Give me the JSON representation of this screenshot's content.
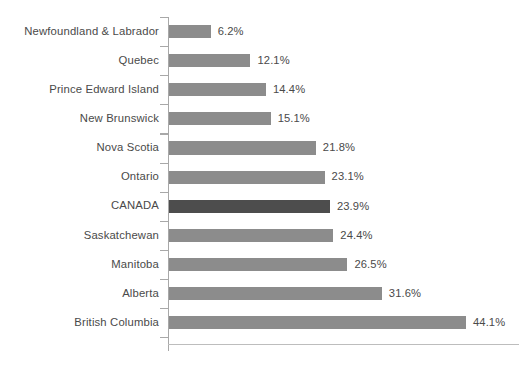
{
  "chart_data": {
    "type": "bar",
    "orientation": "horizontal",
    "title": "",
    "subtitle": "",
    "xlabel": "",
    "ylabel": "",
    "grid": false,
    "legend": null,
    "value_suffix": "%",
    "xlim": [
      0,
      44.1
    ],
    "axis_max_value": 44.1,
    "highlight_category": "CANADA",
    "colors": {
      "bar": "#8c8c8c",
      "bar_highlight": "#4d4d4d",
      "text": "#4a4a4a",
      "axis": "#a8a8a8",
      "baseline": "#bdbdbd",
      "background": "#ffffff"
    },
    "categories": [
      "Newfoundland & Labrador",
      "Quebec",
      "Prince Edward Island",
      "New Brunswick",
      "Nova Scotia",
      "Ontario",
      "CANADA",
      "Saskatchewan",
      "Manitoba",
      "Alberta",
      "British Columbia"
    ],
    "values": [
      6.2,
      12.1,
      14.4,
      15.1,
      21.8,
      23.1,
      23.9,
      24.4,
      26.5,
      31.6,
      44.1
    ],
    "value_labels": [
      "6.2%",
      "12.1%",
      "14.4%",
      "15.1%",
      "21.8%",
      "23.1%",
      "23.9%",
      "24.4%",
      "26.5%",
      "31.6%",
      "44.1%"
    ],
    "bars": [
      {
        "category": "Newfoundland & Labrador",
        "value": 6.2,
        "label": "6.2%",
        "highlighted": false
      },
      {
        "category": "Quebec",
        "value": 12.1,
        "label": "12.1%",
        "highlighted": false
      },
      {
        "category": "Prince Edward Island",
        "value": 14.4,
        "label": "14.4%",
        "highlighted": false
      },
      {
        "category": "New Brunswick",
        "value": 15.1,
        "label": "15.1%",
        "highlighted": false
      },
      {
        "category": "Nova Scotia",
        "value": 21.8,
        "label": "21.8%",
        "highlighted": false
      },
      {
        "category": "Ontario",
        "value": 23.1,
        "label": "23.1%",
        "highlighted": false
      },
      {
        "category": "CANADA",
        "value": 23.9,
        "label": "23.9%",
        "highlighted": true
      },
      {
        "category": "Saskatchewan",
        "value": 24.4,
        "label": "24.4%",
        "highlighted": false
      },
      {
        "category": "Manitoba",
        "value": 26.5,
        "label": "26.5%",
        "highlighted": false
      },
      {
        "category": "Alberta",
        "value": 31.6,
        "label": "31.6%",
        "highlighted": false
      },
      {
        "category": "British Columbia",
        "value": 44.1,
        "label": "44.1%",
        "highlighted": false
      }
    ]
  }
}
